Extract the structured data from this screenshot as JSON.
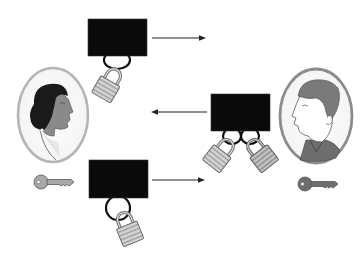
{
  "diagram": {
    "type": "protocol-illustration",
    "title": "",
    "caption": "",
    "participants": [
      {
        "id": "alice",
        "role": "sender",
        "depiction": "woman-profile-portrait",
        "position": "left",
        "key_icon": "key-icon",
        "key_color": "#a9a9a9"
      },
      {
        "id": "bob",
        "role": "receiver",
        "depiction": "man-profile-portrait",
        "position": "right",
        "key_icon": "key-icon",
        "key_color": "#6e6e6e"
      }
    ],
    "steps": [
      {
        "step": 1,
        "box": "black-box",
        "locks": [
          "alice-padlock"
        ],
        "arrow_direction": "right",
        "from": "alice",
        "to": "bob"
      },
      {
        "step": 2,
        "box": "black-box",
        "locks": [
          "alice-padlock",
          "bob-padlock"
        ],
        "arrow_direction": "left",
        "from": "bob",
        "to": "alice"
      },
      {
        "step": 3,
        "box": "black-box",
        "locks": [
          "bob-padlock"
        ],
        "arrow_direction": "right",
        "from": "alice",
        "to": "bob"
      }
    ],
    "colors": {
      "box": "#0a0a0a",
      "frame": "#b5b5b5",
      "frame_man": "#8c8c8c",
      "lock_light": "#c8c8c8",
      "lock_dark": "#9a9a9a",
      "arrow": "#222222",
      "skin": "#8a8a8a",
      "hair_woman": "#1a1a1a",
      "hair_man": "#7a7a7a"
    }
  }
}
